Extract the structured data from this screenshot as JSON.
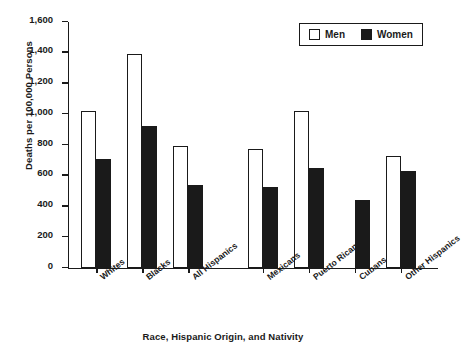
{
  "chart_data": {
    "type": "bar",
    "title": "",
    "xlabel": "Race, Hispanic Origin, and Nativity",
    "ylabel": "Deaths per 100,000 Persons",
    "categories": [
      "Whites",
      "Blacks",
      "All Hispanics",
      "Mexicans",
      "Puerto Ricans",
      "Cubans",
      "Other Hispanics"
    ],
    "series": [
      {
        "name": "Men",
        "values": [
          1020,
          1395,
          795,
          775,
          1020,
          null,
          730
        ]
      },
      {
        "name": "Women",
        "values": [
          710,
          925,
          540,
          525,
          650,
          440,
          630
        ]
      }
    ],
    "ylim": [
      0,
      1600
    ],
    "yticks": [
      0,
      200,
      400,
      600,
      800,
      1000,
      1200,
      1400,
      1600
    ],
    "ytick_labels": [
      "0",
      "200",
      "400",
      "600",
      "800",
      "1,000",
      "1,200",
      "1,400",
      "1,600"
    ],
    "grid": false,
    "legend_position": "top-right",
    "group_gap_after_index": 2,
    "colors": {
      "men": "#ffffff",
      "women": "#1a1a1a",
      "axis": "#1a1a1a"
    }
  },
  "legend": {
    "items": [
      {
        "label": "Men",
        "swatch": "men"
      },
      {
        "label": "Women",
        "swatch": "women"
      }
    ]
  }
}
